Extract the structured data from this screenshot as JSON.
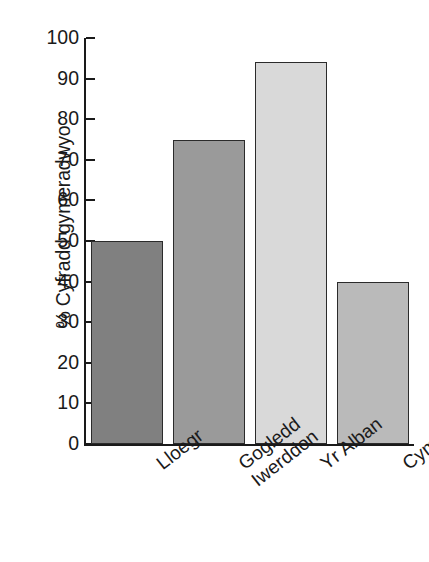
{
  "chart_data": {
    "type": "bar",
    "title": "",
    "subtitle": "",
    "xlabel": "",
    "ylabel": "% Cyfradd gymeradwyo",
    "categories": [
      "Lloegr",
      "Gogledd\nIwerddon",
      "Yr Alban",
      "Cymru"
    ],
    "values": [
      50,
      75,
      94,
      40
    ],
    "ylim": [
      0,
      100
    ],
    "yticks": [
      0,
      10,
      20,
      30,
      40,
      50,
      60,
      70,
      80,
      90,
      100
    ],
    "ytick_labels": [
      "0",
      "10",
      "20",
      "30",
      "40",
      "50",
      "60",
      "70",
      "80",
      "90",
      "100"
    ],
    "grid": false,
    "legend": false,
    "legend_position": "none",
    "bar_colors": [
      "#808080",
      "#9a9a9a",
      "#d9d9d9",
      "#bababa"
    ],
    "bar_edge_color": "#2b2b2b",
    "axis_color": "#1a1a1a",
    "background_color": "#ffffff",
    "xtick_label_rotation": -38,
    "annotations": []
  }
}
